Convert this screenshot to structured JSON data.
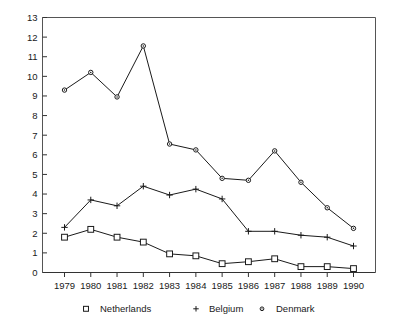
{
  "chart_data": {
    "type": "line",
    "title": "",
    "xlabel": "",
    "ylabel": "",
    "categories": [
      "1979",
      "1980",
      "1981",
      "1982",
      "1983",
      "1984",
      "1985",
      "1986",
      "1987",
      "1988",
      "1989",
      "1990"
    ],
    "ylim": [
      0,
      13
    ],
    "yticks": [
      0,
      1,
      2,
      3,
      4,
      5,
      6,
      7,
      8,
      9,
      10,
      11,
      12,
      13
    ],
    "grid": false,
    "legend_position": "bottom",
    "series": [
      {
        "name": "Netherlands",
        "marker": "open-square",
        "values": [
          1.8,
          2.2,
          1.8,
          1.55,
          0.95,
          0.85,
          0.45,
          0.55,
          0.7,
          0.3,
          0.3,
          0.2
        ]
      },
      {
        "name": "Belgium",
        "marker": "plus",
        "values": [
          2.3,
          3.7,
          3.4,
          4.4,
          3.95,
          4.25,
          3.75,
          2.1,
          2.1,
          1.9,
          1.8,
          1.35
        ]
      },
      {
        "name": "Denmark",
        "marker": "open-circle",
        "values": [
          9.3,
          10.2,
          8.95,
          11.55,
          6.55,
          6.25,
          4.8,
          4.7,
          6.2,
          4.6,
          3.3,
          2.25
        ]
      }
    ]
  },
  "legend": {
    "entries": [
      {
        "marker": "open-square",
        "label": "Netherlands"
      },
      {
        "marker": "plus",
        "label": "Belgium"
      },
      {
        "marker": "open-circle",
        "label": "Denmark"
      }
    ]
  },
  "colors": {
    "ink": "#1a1a1a",
    "frame": "#555555",
    "background": "#ffffff"
  }
}
